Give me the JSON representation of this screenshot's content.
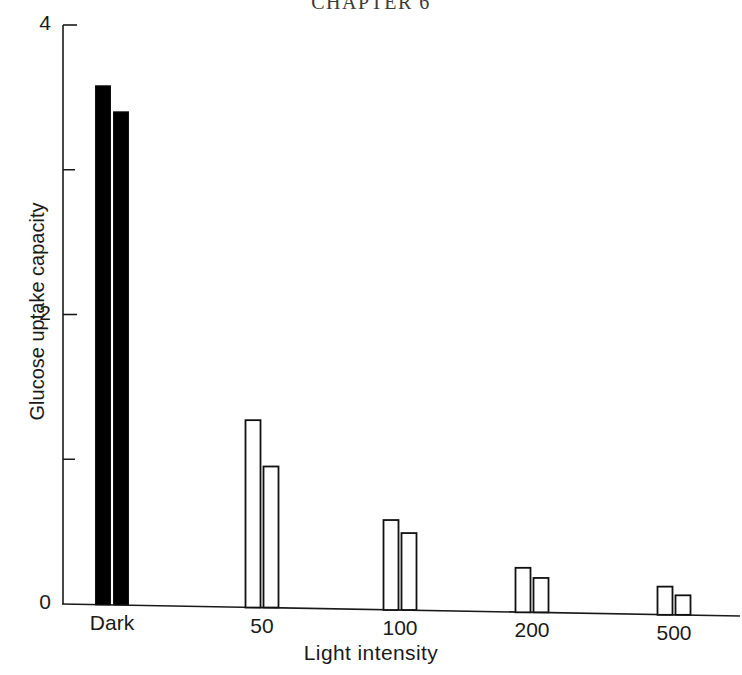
{
  "page": {
    "running_head": "CHAPTER 6"
  },
  "chart_data": {
    "type": "bar",
    "title": "",
    "xlabel": "Light intensity",
    "ylabel": "Glucose uptake capacity",
    "categories": [
      "Dark",
      "50",
      "100",
      "200",
      "500"
    ],
    "series": [
      {
        "name": "bar-1",
        "style": "filled-in-dark-open-in-light",
        "values": [
          3.58,
          1.27,
          0.58,
          0.25,
          0.12
        ]
      },
      {
        "name": "bar-2",
        "style": "filled-in-dark-open-in-light",
        "values": [
          3.4,
          0.95,
          0.49,
          0.18,
          0.06
        ]
      }
    ],
    "ylim": [
      0,
      4
    ],
    "yticks": [
      0,
      2,
      4
    ],
    "ytick_labels": [
      "0",
      "2",
      "4"
    ],
    "yminor_ticks": [
      1,
      3
    ],
    "xtick_labels": [
      "Dark",
      "50",
      "100",
      "200",
      "500"
    ],
    "grid": false,
    "legend": "none",
    "bar_fill_dark": "#000000",
    "bar_fill_light": "#ffffff",
    "bar_edge_color": "#111111",
    "axis_color": "#1a1a1a"
  },
  "layout": {
    "y_axis_x": 63,
    "y_zero_px": 604,
    "px_per_unit": 144.75,
    "group_centers": [
      112,
      262,
      400,
      532,
      674
    ],
    "bar_width": 15,
    "bar_gap": 3
  }
}
